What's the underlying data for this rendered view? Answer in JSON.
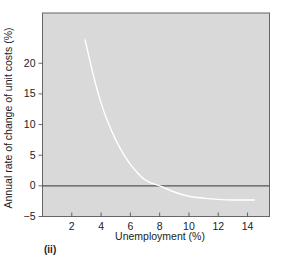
{
  "chart_data": {
    "type": "line",
    "title": "",
    "panel_label": "(ii)",
    "xlabel": "Unemployment (%)",
    "ylabel": "Annual rate of change of unit costs (%)",
    "xlim": [
      0,
      15.5
    ],
    "ylim": [
      -5,
      28.2
    ],
    "x_ticks": [
      2,
      4,
      6,
      8,
      10,
      12,
      14
    ],
    "y_ticks": [
      -5,
      0,
      5,
      10,
      15,
      20
    ],
    "x_tick_labels": [
      "2",
      "4",
      "6",
      "8",
      "10",
      "12",
      "14"
    ],
    "y_tick_labels": [
      "−5",
      "0",
      "5",
      "10",
      "15",
      "20"
    ],
    "grid": false,
    "legend": null,
    "reference_line": {
      "y": 0,
      "color": "#555555"
    },
    "series": [
      {
        "name": "Phillips curve",
        "color": "#ffffff",
        "x": [
          2.9,
          3.5,
          4.0,
          4.5,
          5.0,
          5.5,
          6.0,
          6.5,
          7.0,
          7.5,
          8.0,
          9.0,
          10.0,
          11.0,
          12.0,
          13.0,
          14.5
        ],
        "values": [
          23.9,
          17.8,
          13.5,
          10.2,
          7.5,
          5.3,
          3.5,
          2.1,
          1.0,
          0.4,
          0.0,
          -1.0,
          -1.7,
          -2.0,
          -2.2,
          -2.3,
          -2.3
        ]
      }
    ],
    "background_color": "#d9d9d9",
    "frame_color": "#666666"
  }
}
